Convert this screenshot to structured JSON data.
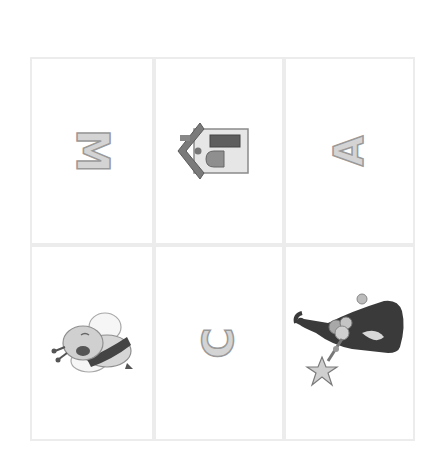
{
  "grid": {
    "rows": 2,
    "columns": 3,
    "cards": [
      {
        "type": "letter",
        "value": "M",
        "rotation": "90deg"
      },
      {
        "type": "picture",
        "value": "house"
      },
      {
        "type": "letter",
        "value": "A",
        "rotation": "-90deg"
      },
      {
        "type": "picture",
        "value": "bee"
      },
      {
        "type": "letter",
        "value": "C",
        "rotation": "-90deg"
      },
      {
        "type": "picture",
        "value": "witch-hat-with-star-wand"
      }
    ]
  },
  "colors": {
    "background": "#ffffff",
    "card_border": "#ececec",
    "letter_fill": "#d4d4d4",
    "letter_stroke": "#9a9a9a",
    "dark_gray": "#555555"
  }
}
